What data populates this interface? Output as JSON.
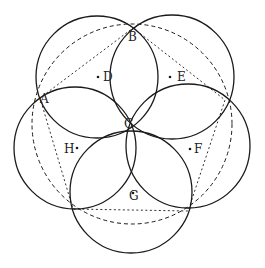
{
  "diagram": {
    "ink_color": "#1a1a1a",
    "background": "#ffffff",
    "circles": [
      {
        "id": "D",
        "cx": 97,
        "cy": 77,
        "r": 61
      },
      {
        "id": "E",
        "cx": 172,
        "cy": 77,
        "r": 62
      },
      {
        "id": "F",
        "cx": 188,
        "cy": 146,
        "r": 62
      },
      {
        "id": "G",
        "cx": 131,
        "cy": 192,
        "r": 61
      },
      {
        "id": "H",
        "cx": 75,
        "cy": 148,
        "r": 61
      }
    ],
    "dashed_circle": {
      "cx": 132,
      "cy": 124,
      "r": 100
    },
    "pentagon": [
      [
        133,
        28
      ],
      [
        225,
        100
      ],
      [
        188,
        211
      ],
      [
        73,
        209
      ],
      [
        40,
        98
      ]
    ],
    "labels": [
      {
        "text": "A",
        "x": 40,
        "y": 103
      },
      {
        "text": "B",
        "x": 128,
        "y": 41
      },
      {
        "text": "C",
        "x": 124,
        "y": 128
      },
      {
        "text": "D",
        "x": 103,
        "y": 81
      },
      {
        "text": "E",
        "x": 177,
        "y": 81
      },
      {
        "text": "F",
        "x": 194,
        "y": 153
      },
      {
        "text": "G",
        "x": 129,
        "y": 200
      },
      {
        "text": "H",
        "x": 64,
        "y": 153
      }
    ],
    "center_dots": [
      {
        "id": "D",
        "x": 98,
        "y": 77
      },
      {
        "id": "E",
        "x": 170,
        "y": 77
      },
      {
        "id": "F",
        "x": 190,
        "y": 149
      },
      {
        "id": "G",
        "x": 133,
        "y": 193
      },
      {
        "id": "H",
        "x": 77,
        "y": 148
      }
    ]
  }
}
